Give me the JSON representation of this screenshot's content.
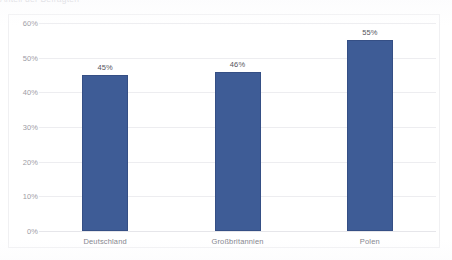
{
  "title": {
    "text": "Anteil der Befragten",
    "cut_off": true
  },
  "chart_data": {
    "type": "bar",
    "title": "Anteil der Befragten",
    "categories": [
      "Deutschland",
      "Großbritannien",
      "Polen"
    ],
    "values": [
      45,
      46,
      55
    ],
    "value_labels": [
      "45%",
      "46%",
      "55%"
    ],
    "xlabel": "",
    "ylabel": "",
    "ylim": [
      0,
      60
    ],
    "ytick_labels": [
      "0%",
      "10%",
      "20%",
      "30%",
      "40%",
      "50%",
      "60%"
    ],
    "ytick_values": [
      0,
      10,
      20,
      30,
      40,
      50,
      60
    ],
    "grid": true,
    "legend": false,
    "series_color": "#3E5C96"
  },
  "colors": {
    "bar": "#3E5C96",
    "gridline": "#EDEDF0",
    "panel_border": "#F0F0F2",
    "axis_text": "#9D9DA6",
    "category_text": "#7E7E88",
    "value_text": "#55555E",
    "background": "#FFFFFF"
  }
}
